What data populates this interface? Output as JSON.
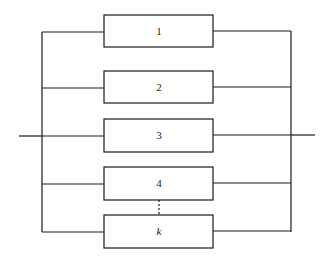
{
  "diagram": {
    "type": "parallel-system-block-diagram",
    "components": [
      {
        "label": "1",
        "italic": false
      },
      {
        "label": "2",
        "italic": false
      },
      {
        "label": "3",
        "italic": false
      },
      {
        "label": "4",
        "italic": false
      },
      {
        "label": "k",
        "italic": true
      }
    ],
    "ellipsis_between": [
      "4",
      "k"
    ],
    "input_line": true,
    "output_line": true
  }
}
